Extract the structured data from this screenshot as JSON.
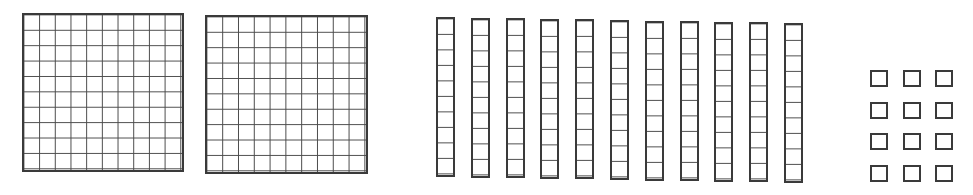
{
  "colors": {
    "stroke": "#3a3a3a",
    "background": "#ffffff"
  },
  "blocks": {
    "hundreds": {
      "count": 2,
      "grid": [
        10,
        10
      ]
    },
    "tens": {
      "count": 11,
      "cells_per_rod": 10
    },
    "ones": {
      "count": 12,
      "arrangement": [
        4,
        3
      ]
    }
  },
  "represented_value": "2 hundreds, 11 tens, 12 ones"
}
